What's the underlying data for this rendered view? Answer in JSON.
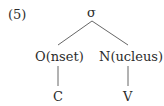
{
  "example_number": "(5)",
  "tree": {
    "root": "σ",
    "children": [
      {
        "label": "O(nset)",
        "child": "C"
      },
      {
        "label": "N(ucleus)",
        "child": "V"
      }
    ]
  },
  "colors": {
    "text": "#2b2b2b",
    "line": "#555555"
  }
}
